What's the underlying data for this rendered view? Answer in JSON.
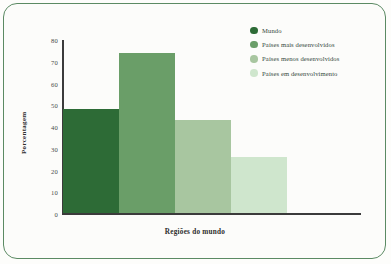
{
  "chart_data": {
    "type": "bar",
    "title": "",
    "subtitle": "",
    "xlabel": "Regiões do mundo",
    "ylabel": "Porcentagem",
    "categories": [
      "Mundo",
      "Países mais desenvolvidos",
      "Países menos desenvolvidos",
      "Países em desenvolvimento"
    ],
    "values": [
      48,
      74,
      43,
      26
    ],
    "ylim": [
      0,
      80
    ],
    "yticks": [
      0,
      10,
      20,
      30,
      40,
      50,
      60,
      70,
      80
    ],
    "ytick_labels": [
      "0",
      "10",
      "20",
      "30",
      "40",
      "50",
      "60",
      "70",
      "80"
    ],
    "xtick_labels": [],
    "grid": false,
    "legend_position": "top-right",
    "bar_gap": 0,
    "colors": [
      "#2d6b36",
      "#6a9e68",
      "#a8c6a0",
      "#cfe6cd"
    ],
    "annotations": []
  },
  "legend": {
    "items": [
      {
        "label": "Mundo",
        "color": "#2d6b36"
      },
      {
        "label": "Países mais desenvolvidos",
        "color": "#6a9e68"
      },
      {
        "label": "Países menos desenvolvidos",
        "color": "#a8c6a0"
      },
      {
        "label": "Países em desenvolvimento",
        "color": "#cfe6cd"
      }
    ]
  },
  "frame": {
    "border_color": "#5b8a63",
    "background": "#fcfcfa",
    "axis_color": "#3b3b3b"
  }
}
